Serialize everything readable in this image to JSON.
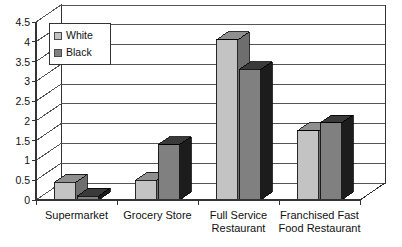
{
  "chart_data": {
    "type": "bar",
    "title": "",
    "subtitle": "",
    "xlabel": "",
    "ylabel": "",
    "categories": [
      "Supermarket",
      "Grocery Store",
      "Full Service Restaurant",
      "Franchised Fast Food Restaurant"
    ],
    "category_label_lines": [
      [
        "Supermarket"
      ],
      [
        "Grocery Store"
      ],
      [
        "Full Service",
        "Restaurant"
      ],
      [
        "Franchised Fast",
        "Food Restaurant"
      ]
    ],
    "series": [
      {
        "name": "White",
        "values": [
          0.45,
          0.5,
          4.05,
          1.75
        ],
        "color": "#c3c3c3"
      },
      {
        "name": "Black",
        "values": [
          0.1,
          1.4,
          3.3,
          1.95
        ],
        "color": "#808080"
      }
    ],
    "ylim": [
      0,
      4.5
    ],
    "ytick_step": 0.5,
    "yticks": [
      "0",
      "0.5",
      "1",
      "1.5",
      "2",
      "2.5",
      "3",
      "3.5",
      "4",
      "4.5"
    ],
    "grid": true,
    "grid_axis": "y",
    "legend": {
      "position": "top-left-inside",
      "entries": [
        "White",
        "Black"
      ]
    },
    "style": "3d-column",
    "colors": {
      "white_face": "#c3c3c3",
      "white_top": "#8f8f8f",
      "white_side": "#6e6e6e",
      "black_face": "#808080",
      "black_top": "#3a3a3a",
      "black_side": "#1c1c1c",
      "plot_background": "#ffffff",
      "floor": "#ffffff",
      "gridline": "#555555",
      "axis": "#333333",
      "text": "#111111"
    }
  },
  "legend": {
    "entries": [
      {
        "label": "White"
      },
      {
        "label": "Black"
      }
    ]
  },
  "axis": {
    "y_ticks": [
      "4.5",
      "4",
      "3.5",
      "3",
      "2.5",
      "2",
      "1.5",
      "1",
      "0.5",
      "0"
    ]
  }
}
